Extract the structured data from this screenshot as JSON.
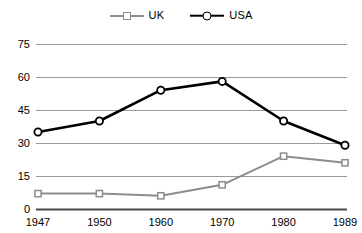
{
  "chart_data": {
    "type": "line",
    "title": "",
    "subtitle": "",
    "xlabel": "",
    "ylabel": "",
    "categories": [
      "1947",
      "1950",
      "1960",
      "1970",
      "1980",
      "1989"
    ],
    "series": [
      {
        "name": "UK",
        "color": "#8c8c8c",
        "marker": "square",
        "values": [
          7,
          7,
          6,
          11,
          24,
          21
        ]
      },
      {
        "name": "USA",
        "color": "#000000",
        "marker": "circle",
        "values": [
          35,
          40,
          54,
          58,
          40,
          29
        ]
      }
    ],
    "ylim": [
      0,
      75
    ],
    "yticks": [
      0,
      15,
      30,
      45,
      60,
      75
    ],
    "ytick_labels": [
      "0",
      "15",
      "30",
      "45",
      "60",
      "75"
    ],
    "xtick_labels": [
      "1947",
      "1950",
      "1960",
      "1970",
      "1980",
      "1989"
    ],
    "grid": "horizontal",
    "legend_position": "top-center"
  },
  "legend": {
    "entries": [
      {
        "label": "UK"
      },
      {
        "label": "USA"
      }
    ]
  },
  "colors": {
    "uk": "#8c8c8c",
    "usa": "#000000",
    "gridline": "#9a9a9a",
    "axis": "#4a4a4a",
    "background": "#ffffff"
  }
}
